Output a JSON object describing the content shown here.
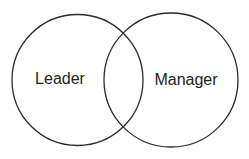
{
  "diagram": {
    "type": "venn",
    "sets": [
      {
        "label": "Leader"
      },
      {
        "label": "Manager"
      }
    ],
    "stroke_color": "#2a2a2a",
    "text_color": "#222222"
  }
}
